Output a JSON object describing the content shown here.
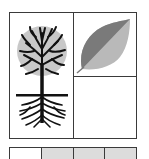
{
  "figure": {
    "panel": {
      "cells": [
        {
          "id": "tree",
          "icon": "tree-with-roots-icon",
          "description": "Tree with round gray crown, black branches, trunk, ground line and roots"
        },
        {
          "id": "leaf",
          "icon": "leaf-icon",
          "description": "Leaf split diagonally into dark gray and light gray halves"
        },
        {
          "id": "empty",
          "icon": null,
          "description": "Empty cell"
        }
      ]
    },
    "strip": {
      "swatches": [
        {
          "color": "#ffffff"
        },
        {
          "color": "#dcdcdc"
        },
        {
          "color": "#dcdcdc"
        },
        {
          "color": "#dcdcdc"
        }
      ]
    },
    "colors": {
      "border": "#3a3a3a",
      "crown": "#c8c8c8",
      "branches": "#111111",
      "leaf_dark": "#7a7a7a",
      "leaf_light": "#b9b9b9",
      "swatch_gray": "#dcdcdc"
    }
  }
}
